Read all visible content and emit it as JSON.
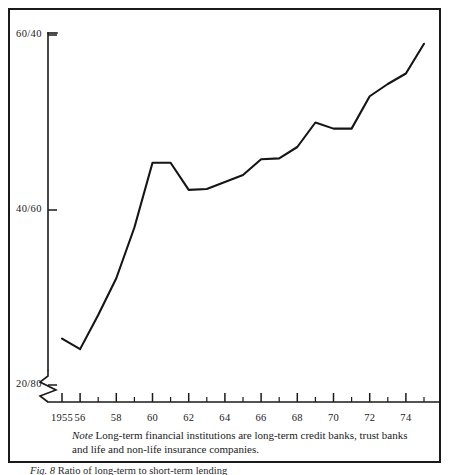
{
  "figure": {
    "note_word": "Note",
    "note_text": "Long-term financial institutions are long-term credit banks, trust banks and life and non-life insurance companies.",
    "caption_label": "Fig. 8",
    "caption_text": "Ratio of long-term to short-term lending"
  },
  "chart_data": {
    "type": "line",
    "title": "",
    "subtitle": "",
    "xlabel": "",
    "ylabel": "",
    "grid": false,
    "legend": "none",
    "axis_break_y": true,
    "y_tick_labels": [
      "60/40",
      "40/60",
      "20/80"
    ],
    "y_tick_values": [
      60,
      40,
      20
    ],
    "ylim": [
      20,
      62
    ],
    "xlim": [
      1954.6,
      1975.4
    ],
    "x_major_ticks": [
      1955,
      1956,
      1958,
      1960,
      1962,
      1964,
      1966,
      1968,
      1970,
      1972,
      1974
    ],
    "x_major_tick_labels": [
      "1955",
      "56",
      "58",
      "60",
      "62",
      "64",
      "66",
      "68",
      "70",
      "72",
      "74"
    ],
    "x_minor_ticks": [
      1957,
      1959,
      1961,
      1963,
      1965,
      1967,
      1969,
      1971,
      1973,
      1975
    ],
    "series": [
      {
        "name": "long-term share",
        "x": [
          1955,
          1956,
          1957,
          1958,
          1959,
          1960,
          1961,
          1962,
          1963,
          1964,
          1965,
          1966,
          1967,
          1968,
          1969,
          1970,
          1971,
          1972,
          1973,
          1974,
          1975
        ],
        "values": [
          25.3,
          24.1,
          28.0,
          32.2,
          38.0,
          45.4,
          45.4,
          42.3,
          42.4,
          43.2,
          44.0,
          45.8,
          45.9,
          47.2,
          50.0,
          49.3,
          49.3,
          53.0,
          54.4,
          55.6,
          59.0
        ]
      }
    ]
  }
}
